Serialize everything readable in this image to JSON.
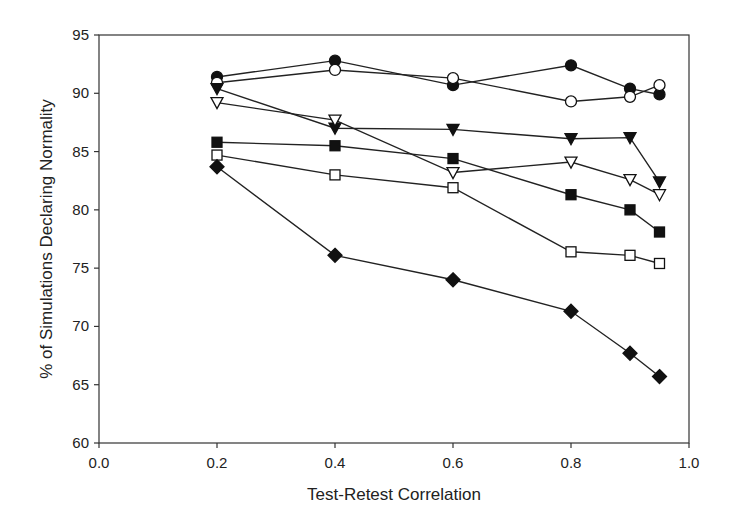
{
  "chart_data": {
    "type": "line",
    "title": "",
    "xlabel": "Test-Retest Correlation",
    "ylabel": "% of Simulations Declaring Normality",
    "xlim": [
      0.0,
      1.0
    ],
    "ylim": [
      60,
      95
    ],
    "xticks": [
      "0.0",
      "0.2",
      "0.4",
      "0.6",
      "0.8",
      "1.0"
    ],
    "yticks": [
      "60",
      "65",
      "70",
      "75",
      "80",
      "85",
      "90",
      "95"
    ],
    "grid": false,
    "legend": null,
    "x": [
      0.2,
      0.4,
      0.6,
      0.8,
      0.9,
      0.95
    ],
    "series": [
      {
        "name": "filled-circle",
        "marker": "circle",
        "filled": true,
        "values": [
          91.4,
          92.8,
          90.7,
          92.4,
          90.4,
          89.9
        ]
      },
      {
        "name": "open-circle",
        "marker": "circle",
        "filled": false,
        "values": [
          90.9,
          92.0,
          91.3,
          89.3,
          89.7,
          90.7
        ]
      },
      {
        "name": "filled-triangle",
        "marker": "triangle-down",
        "filled": true,
        "values": [
          90.4,
          87.0,
          86.9,
          86.1,
          86.2,
          82.4
        ]
      },
      {
        "name": "open-triangle",
        "marker": "triangle-down",
        "filled": false,
        "values": [
          89.2,
          87.7,
          83.2,
          84.1,
          82.6,
          81.3
        ]
      },
      {
        "name": "filled-square",
        "marker": "square",
        "filled": true,
        "values": [
          85.8,
          85.5,
          84.4,
          81.3,
          80.0,
          78.1
        ]
      },
      {
        "name": "open-square",
        "marker": "square",
        "filled": false,
        "values": [
          84.7,
          83.0,
          81.9,
          76.4,
          76.1,
          75.4
        ]
      },
      {
        "name": "filled-diamond",
        "marker": "diamond",
        "filled": true,
        "values": [
          83.7,
          76.1,
          74.0,
          71.3,
          67.7,
          65.7
        ]
      }
    ]
  }
}
